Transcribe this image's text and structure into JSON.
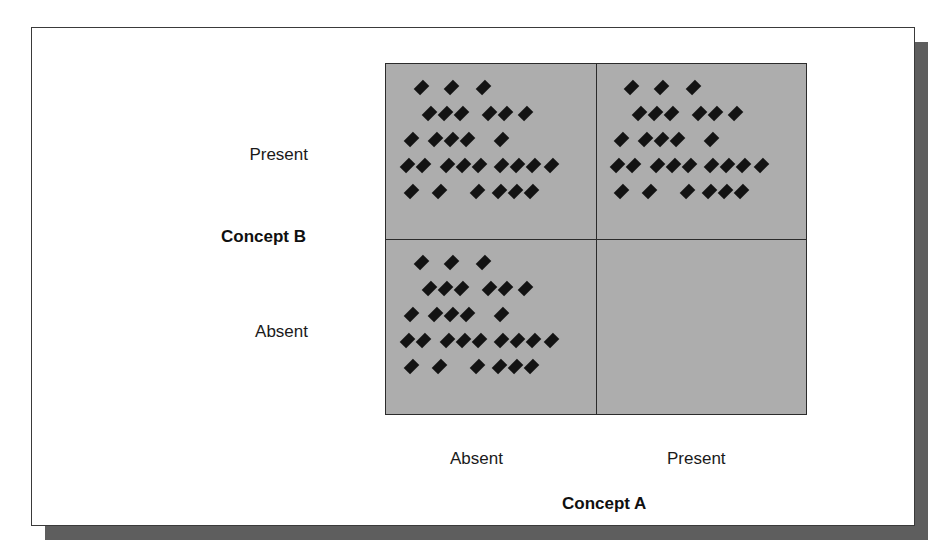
{
  "figure": {
    "kind": "two-by-two-scatter-matrix",
    "background_color": "#ffffff",
    "panel_border_color": "#3a3a3a",
    "shadow_color": "#5e5e5e"
  },
  "axes": {
    "x": {
      "title": "Concept A",
      "ticks": [
        "Absent",
        "Present"
      ]
    },
    "y": {
      "title": "Concept B",
      "ticks": [
        "Present",
        "Absent"
      ]
    }
  },
  "chart_data": {
    "type": "scatter",
    "title": "",
    "subtitle": "",
    "xlabel": "Concept A",
    "ylabel": "Concept B",
    "x_tick_labels": [
      "Absent",
      "Present"
    ],
    "y_tick_labels": [
      "Present",
      "Absent"
    ],
    "grid": false,
    "legend": null,
    "plot_background_color": "#adadad",
    "marker": {
      "shape": "diamond",
      "color": "#131313",
      "size_px": 9
    },
    "quadrants": [
      {
        "name": "present-absent",
        "x_category": "Absent",
        "y_category": "Present",
        "position": "top-left",
        "point_count": 29,
        "rows": [
          {
            "offsets": [
              18,
              48,
              80
            ]
          },
          {
            "offsets": [
              26,
              42,
              58,
              86,
              102,
              122
            ]
          },
          {
            "offsets": [
              8,
              32,
              48,
              64,
              98
            ]
          },
          {
            "offsets": [
              4,
              20,
              44,
              60,
              76,
              98,
              114,
              130,
              148
            ]
          },
          {
            "offsets": [
              8,
              36,
              74,
              96,
              112,
              128
            ]
          }
        ]
      },
      {
        "name": "present-present",
        "x_category": "Present",
        "y_category": "Present",
        "position": "top-right",
        "point_count": 29,
        "rows": [
          {
            "offsets": [
              18,
              48,
              80
            ]
          },
          {
            "offsets": [
              26,
              42,
              58,
              86,
              102,
              122
            ]
          },
          {
            "offsets": [
              8,
              32,
              48,
              64,
              98
            ]
          },
          {
            "offsets": [
              4,
              20,
              44,
              60,
              76,
              98,
              114,
              130,
              148
            ]
          },
          {
            "offsets": [
              8,
              36,
              74,
              96,
              112,
              128
            ]
          }
        ]
      },
      {
        "name": "absent-absent",
        "x_category": "Absent",
        "y_category": "Absent",
        "position": "bottom-left",
        "point_count": 29,
        "rows": [
          {
            "offsets": [
              18,
              48,
              80
            ]
          },
          {
            "offsets": [
              26,
              42,
              58,
              86,
              102,
              122
            ]
          },
          {
            "offsets": [
              8,
              32,
              48,
              64,
              98
            ]
          },
          {
            "offsets": [
              4,
              20,
              44,
              60,
              76,
              98,
              114,
              130,
              148
            ]
          },
          {
            "offsets": [
              8,
              36,
              74,
              96,
              112,
              128
            ]
          }
        ]
      },
      {
        "name": "absent-present",
        "x_category": "Present",
        "y_category": "Absent",
        "position": "bottom-right",
        "point_count": 0,
        "rows": []
      }
    ]
  }
}
